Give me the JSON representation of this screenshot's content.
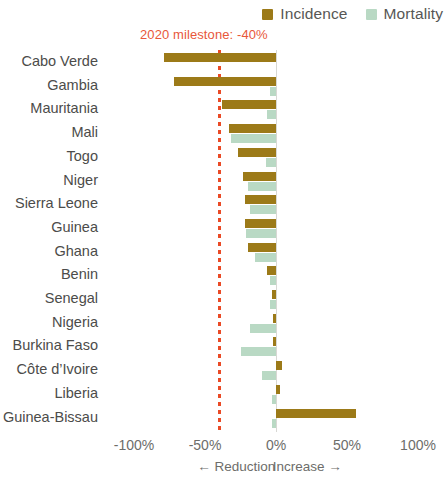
{
  "legend": {
    "items": [
      {
        "label": "Incidence",
        "color": "#9c7a18",
        "icon": "square-swatch-icon"
      },
      {
        "label": "Mortality",
        "color": "#b9d9c4",
        "icon": "square-swatch-icon"
      }
    ]
  },
  "annotation": {
    "milestone_text": "2020 milestone: -40%",
    "milestone_value": -40,
    "color": "#e8573a"
  },
  "axis": {
    "ticks": [
      "-100%",
      "-50%",
      "0%",
      "50%",
      "100%"
    ],
    "tick_values": [
      -100,
      -50,
      0,
      50,
      100
    ],
    "captions": [
      {
        "text": "← Reduction",
        "value": -28
      },
      {
        "text": "Increase →",
        "value": 22
      }
    ]
  },
  "chart_data": {
    "type": "bar",
    "orientation": "horizontal",
    "title": "",
    "xlabel": "",
    "ylabel": "",
    "xlim": [
      -100,
      100
    ],
    "grid": false,
    "legend_position": "top-right",
    "categories": [
      "Cabo Verde",
      "Gambia",
      "Mauritania",
      "Mali",
      "Togo",
      "Niger",
      "Sierra Leone",
      "Guinea",
      "Ghana",
      "Benin",
      "Senegal",
      "Nigeria",
      "Burkina Faso",
      "Côte d’Ivoire",
      "Liberia",
      "Guinea-Bissau"
    ],
    "series": [
      {
        "name": "Incidence",
        "color": "#9c7a18",
        "values": [
          -79,
          -72,
          -38,
          -33,
          -27,
          -23,
          -22,
          -22,
          -20,
          -6,
          -3,
          -2,
          -2,
          4,
          3,
          56
        ]
      },
      {
        "name": "Mortality",
        "color": "#b9d9c4",
        "values": [
          0,
          -4,
          -6,
          -32,
          -7,
          -20,
          -18,
          -21,
          -15,
          -4,
          -4,
          -18,
          -25,
          -10,
          -3,
          -3
        ]
      }
    ],
    "reference_line": {
      "label": "2020 milestone: -40%",
      "value": -40,
      "color": "#e8573a",
      "style": "dotted"
    }
  }
}
